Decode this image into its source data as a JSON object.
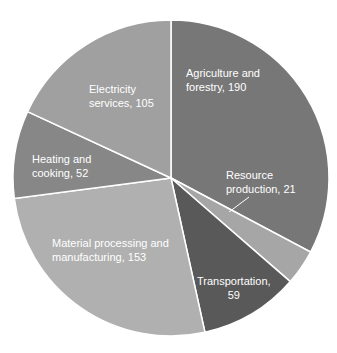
{
  "chart_data": {
    "type": "pie",
    "title": "",
    "start_angle": "12 o'clock, clockwise",
    "slices": [
      {
        "label": "Agriculture and forestry",
        "value": 190,
        "color": "#777777",
        "text": "Agriculture and forestry, 190"
      },
      {
        "label": "Resource production",
        "value": 21,
        "color": "#a6a6a6",
        "text": "Resource production, 21"
      },
      {
        "label": "Transportation",
        "value": 59,
        "color": "#595959",
        "text": "Transportation, 59"
      },
      {
        "label": "Material processing and manufacturing",
        "value": 153,
        "color": "#b0b0b0",
        "text": "Material processing and manufacturing, 153"
      },
      {
        "label": "Heating and cooking",
        "value": 52,
        "color": "#878787",
        "text": "Heating and cooking, 52"
      },
      {
        "label": "Electricity services",
        "value": 105,
        "color": "#a0a0a0",
        "text": "Electricity services, 105"
      }
    ],
    "categories": [
      "Agriculture and forestry",
      "Resource production",
      "Transportation",
      "Material processing and manufacturing",
      "Heating and cooking",
      "Electricity services"
    ],
    "values": [
      190,
      21,
      59,
      153,
      52,
      105
    ],
    "legend": "none (data labels on slices)"
  },
  "labels": {
    "agri_1": "Agriculture and",
    "agri_2": "forestry, 190",
    "res_1": "Resource",
    "res_2": "production, 21",
    "trans_1": "Transportation,",
    "trans_2": "59",
    "mat_1": "Material processing and",
    "mat_2": "manufacturing, 153",
    "heat_1": "Heating and",
    "heat_2": "cooking, 52",
    "elec_1": "Electricity",
    "elec_2": "services, 105"
  }
}
